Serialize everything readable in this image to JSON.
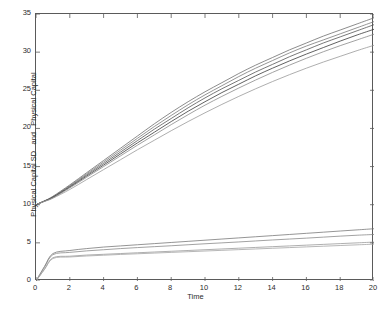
{
  "chart_data": {
    "type": "line",
    "title": "",
    "xlabel": "Time",
    "ylabel": "Physical Capital SD   and   Physical Capital",
    "xlim": [
      0,
      20
    ],
    "ylim": [
      0,
      35
    ],
    "xticks": [
      0,
      2,
      4,
      6,
      8,
      10,
      12,
      14,
      16,
      18,
      20
    ],
    "yticks": [
      0,
      5,
      10,
      15,
      20,
      25,
      30,
      35
    ],
    "grid": false,
    "legend": "none",
    "x": [
      0,
      0.5,
      1,
      2,
      3,
      4,
      5,
      6,
      7,
      8,
      9,
      10,
      11,
      12,
      13,
      14,
      15,
      16,
      17,
      18,
      19,
      20
    ],
    "series": [
      {
        "name": "Physical Capital 1",
        "group": "physical-capital",
        "color": "#6e6e6e",
        "values": [
          10.0,
          10.5,
          11.1,
          12.6,
          14.2,
          15.8,
          17.4,
          19.0,
          20.6,
          22.1,
          23.5,
          24.8,
          26.0,
          27.2,
          28.3,
          29.3,
          30.3,
          31.2,
          32.1,
          32.9,
          33.7,
          34.5
        ]
      },
      {
        "name": "Physical Capital 2",
        "group": "physical-capital",
        "color": "#7a7a7a",
        "values": [
          10.0,
          10.5,
          11.05,
          12.5,
          14.05,
          15.6,
          17.15,
          18.7,
          20.25,
          21.7,
          23.1,
          24.4,
          25.6,
          26.8,
          27.9,
          28.9,
          29.9,
          30.8,
          31.6,
          32.4,
          33.2,
          34.0
        ]
      },
      {
        "name": "Physical Capital 3",
        "group": "physical-capital",
        "color": "#555555",
        "values": [
          10.0,
          10.48,
          11.0,
          12.4,
          13.9,
          15.4,
          16.9,
          18.4,
          19.9,
          21.3,
          22.7,
          24.0,
          25.2,
          26.3,
          27.4,
          28.4,
          29.4,
          30.3,
          31.2,
          32.0,
          32.8,
          33.6
        ]
      },
      {
        "name": "Physical Capital 4",
        "group": "physical-capital",
        "color": "#3a3a3a",
        "values": [
          10.0,
          10.47,
          10.95,
          12.3,
          13.75,
          15.2,
          16.65,
          18.1,
          19.5,
          20.9,
          22.25,
          23.5,
          24.7,
          25.8,
          26.9,
          27.9,
          28.85,
          29.75,
          30.6,
          31.45,
          32.25,
          33.0
        ]
      },
      {
        "name": "Physical Capital 5",
        "group": "physical-capital",
        "color": "#8a8a8a",
        "values": [
          10.0,
          10.45,
          10.9,
          12.2,
          13.6,
          15.0,
          16.4,
          17.8,
          19.15,
          20.5,
          21.8,
          23.05,
          24.2,
          25.3,
          26.35,
          27.35,
          28.3,
          29.2,
          30.05,
          30.85,
          31.6,
          32.35
        ]
      },
      {
        "name": "Physical Capital 6",
        "group": "physical-capital",
        "color": "#999999",
        "values": [
          10.0,
          10.42,
          10.85,
          12.0,
          13.3,
          14.6,
          15.9,
          17.2,
          18.45,
          19.7,
          20.9,
          22.05,
          23.15,
          24.2,
          25.2,
          26.15,
          27.05,
          27.9,
          28.7,
          29.45,
          30.2,
          30.9
        ]
      },
      {
        "name": "Physical Capital SD 1",
        "group": "physical-capital-sd",
        "color": "#7a7a7a",
        "values": [
          0.0,
          1.9,
          3.6,
          4.0,
          4.25,
          4.45,
          4.6,
          4.75,
          4.9,
          5.05,
          5.2,
          5.35,
          5.5,
          5.65,
          5.8,
          5.95,
          6.1,
          6.25,
          6.4,
          6.55,
          6.7,
          6.85
        ]
      },
      {
        "name": "Physical Capital SD 2",
        "group": "physical-capital-sd",
        "color": "#8a8a8a",
        "values": [
          0.0,
          1.8,
          3.45,
          3.75,
          3.95,
          4.1,
          4.25,
          4.38,
          4.5,
          4.62,
          4.75,
          4.88,
          5.0,
          5.12,
          5.25,
          5.38,
          5.5,
          5.62,
          5.75,
          5.88,
          6.0,
          6.1
        ]
      },
      {
        "name": "Physical Capital SD 3",
        "group": "physical-capital-sd",
        "color": "#9a9a9a",
        "values": [
          0.0,
          1.55,
          3.05,
          3.25,
          3.4,
          3.5,
          3.6,
          3.7,
          3.8,
          3.9,
          4.0,
          4.1,
          4.2,
          4.3,
          4.4,
          4.5,
          4.6,
          4.7,
          4.8,
          4.9,
          5.0,
          5.1
        ]
      },
      {
        "name": "Physical Capital SD 4",
        "group": "physical-capital-sd",
        "color": "#a5a5a5",
        "values": [
          0.0,
          1.5,
          2.95,
          3.15,
          3.28,
          3.38,
          3.48,
          3.57,
          3.66,
          3.75,
          3.84,
          3.93,
          4.02,
          4.11,
          4.2,
          4.29,
          4.38,
          4.47,
          4.56,
          4.65,
          4.74,
          4.83
        ]
      }
    ]
  },
  "axis": {
    "xtick_labels": [
      "0",
      "2",
      "4",
      "6",
      "8",
      "10",
      "12",
      "14",
      "16",
      "18",
      "20"
    ],
    "ytick_labels": [
      "0",
      "5",
      "10",
      "15",
      "20",
      "25",
      "30",
      "35"
    ],
    "xlabel_text": "Time",
    "ylabel_text": "Physical Capital SD   and   Physical Capital"
  }
}
